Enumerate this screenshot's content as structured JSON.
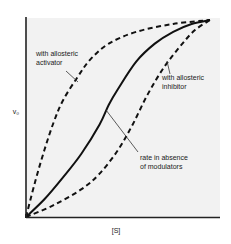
{
  "chart_data": {
    "type": "line",
    "title": "",
    "xlabel": "[S]",
    "ylabel": "v₀",
    "xlim": [
      0,
      1
    ],
    "ylim": [
      0,
      1
    ],
    "grid": false,
    "legend": "none",
    "series": [
      {
        "name": "with allosteric activator",
        "style": "dashed",
        "x": [
          0,
          0.05,
          0.1,
          0.15,
          0.2,
          0.28,
          0.35,
          0.45,
          0.6,
          0.8,
          1.0
        ],
        "y": [
          0,
          0.18,
          0.34,
          0.48,
          0.59,
          0.71,
          0.8,
          0.88,
          0.94,
          0.98,
          1.0
        ]
      },
      {
        "name": "rate in absence of modulators",
        "style": "solid",
        "x": [
          0,
          0.1,
          0.2,
          0.3,
          0.4,
          0.45,
          0.5,
          0.6,
          0.7,
          0.8,
          0.9,
          1.0
        ],
        "y": [
          0,
          0.09,
          0.2,
          0.32,
          0.47,
          0.57,
          0.65,
          0.79,
          0.88,
          0.94,
          0.98,
          1.0
        ]
      },
      {
        "name": "with allosteric inhibitor",
        "style": "dashed",
        "x": [
          0,
          0.15,
          0.3,
          0.4,
          0.5,
          0.58,
          0.66,
          0.75,
          0.85,
          0.92,
          1.0
        ],
        "y": [
          0,
          0.06,
          0.14,
          0.22,
          0.34,
          0.47,
          0.62,
          0.76,
          0.88,
          0.95,
          1.0
        ]
      }
    ],
    "annotations": [
      {
        "text_lines": [
          "with allosteric",
          "activator"
        ],
        "series": "with allosteric activator",
        "point": [
          0.28,
          0.68
        ]
      },
      {
        "text_lines": [
          "with allosteric",
          "inhibitor"
        ],
        "series": "with allosteric inhibitor",
        "point": [
          0.77,
          0.78
        ]
      },
      {
        "text_lines": [
          "rate in absence",
          "of modulators"
        ],
        "series": "rate in absence of modulators",
        "point": [
          0.42,
          0.5
        ]
      }
    ]
  }
}
